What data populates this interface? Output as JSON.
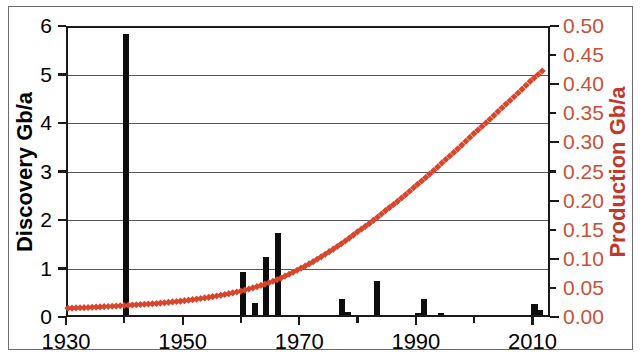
{
  "chart_data": {
    "type": "bar",
    "title": "",
    "subtitle": "",
    "xlabel": "",
    "ylabel": "Discovery Gb/a",
    "y2label": "Production Gb/a",
    "xlim": [
      1930,
      2013
    ],
    "ylim": [
      0,
      6
    ],
    "y2lim": [
      0.0,
      0.5
    ],
    "grid": true,
    "legend": "none",
    "x_ticks_major": [
      "1930",
      "1950",
      "1970",
      "1990",
      "2010"
    ],
    "x_ticks_major_values": [
      1930,
      1950,
      1970,
      1990,
      2010
    ],
    "x_ticks_minor_values": [
      1940,
      1960,
      1980,
      2000
    ],
    "y_ticks_left": [
      "0",
      "1",
      "2",
      "3",
      "4",
      "5",
      "6"
    ],
    "y_ticks_left_values": [
      0,
      1,
      2,
      3,
      4,
      5,
      6
    ],
    "y_ticks_right": [
      "0.00",
      "0.05",
      "0.10",
      "0.15",
      "0.20",
      "0.25",
      "0.30",
      "0.35",
      "0.40",
      "0.45",
      "0.50"
    ],
    "y_ticks_right_values": [
      0.0,
      0.05,
      0.1,
      0.15,
      0.2,
      0.25,
      0.3,
      0.35,
      0.4,
      0.45,
      0.5
    ],
    "series": [
      {
        "name": "Discovery Gb/a",
        "type": "bar",
        "axis": "left",
        "color": "#0d0d0d",
        "x": [
          1940,
          1960,
          1962,
          1964,
          1966,
          1977,
          1978,
          1983,
          1990,
          1991,
          1994,
          2010,
          2011
        ],
        "values": [
          5.8,
          0.88,
          0.24,
          1.2,
          1.7,
          0.33,
          0.07,
          0.71,
          0.04,
          0.33,
          0.04,
          0.22,
          0.1
        ]
      },
      {
        "name": "Production Gb/a",
        "type": "line",
        "axis": "right",
        "color": "#d8452b",
        "marker": "diamond",
        "x": [
          1930,
          1935,
          1940,
          1945,
          1950,
          1955,
          1960,
          1965,
          1970,
          1975,
          1980,
          1985,
          1990,
          1995,
          2000,
          2005,
          2010,
          2012
        ],
        "values": [
          0.011,
          0.013,
          0.016,
          0.019,
          0.024,
          0.031,
          0.041,
          0.056,
          0.079,
          0.108,
          0.143,
          0.181,
          0.222,
          0.266,
          0.312,
          0.358,
          0.405,
          0.422
        ]
      }
    ]
  },
  "axes": {
    "left_axis_label": "Discovery Gb/a",
    "right_axis_label": "Production Gb/a",
    "left_tick_labels": [
      "6",
      "5",
      "4",
      "3",
      "2",
      "1",
      "0"
    ],
    "right_tick_labels": [
      "0.50",
      "0.45",
      "0.40",
      "0.35",
      "0.30",
      "0.25",
      "0.20",
      "0.15",
      "0.10",
      "0.05",
      "0.00"
    ],
    "x_tick_labels": [
      "1930",
      "1950",
      "1970",
      "1990",
      "2010"
    ]
  },
  "colors": {
    "discovery_bar": "#0d0d0d",
    "production_line": "#d8452b",
    "right_axis_text": "#c9503a",
    "gridline": "#58595b",
    "axis": "#1a1a1a",
    "frame": "#6c6c6c",
    "background": "#ffffff"
  }
}
